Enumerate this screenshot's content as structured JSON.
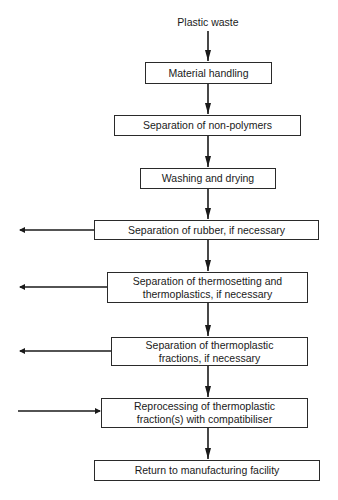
{
  "diagram": {
    "type": "flowchart",
    "start": "Plastic waste",
    "steps": [
      {
        "label": "Material handling"
      },
      {
        "label": "Separation of non-polymers"
      },
      {
        "label": "Washing and drying"
      },
      {
        "label": "Separation of rubber, if necessary",
        "side_arrow": "out-left"
      },
      {
        "label": "Separation of thermosetting and thermoplastics, if necessary",
        "side_arrow": "out-left"
      },
      {
        "label": "Separation of thermoplastic fractions, if necessary",
        "side_arrow": "out-left"
      },
      {
        "label": "Reprocessing of thermoplastic fraction(s) with compatibiliser",
        "side_arrow": "in-left"
      },
      {
        "label": "Return to manufacturing facility"
      }
    ]
  }
}
